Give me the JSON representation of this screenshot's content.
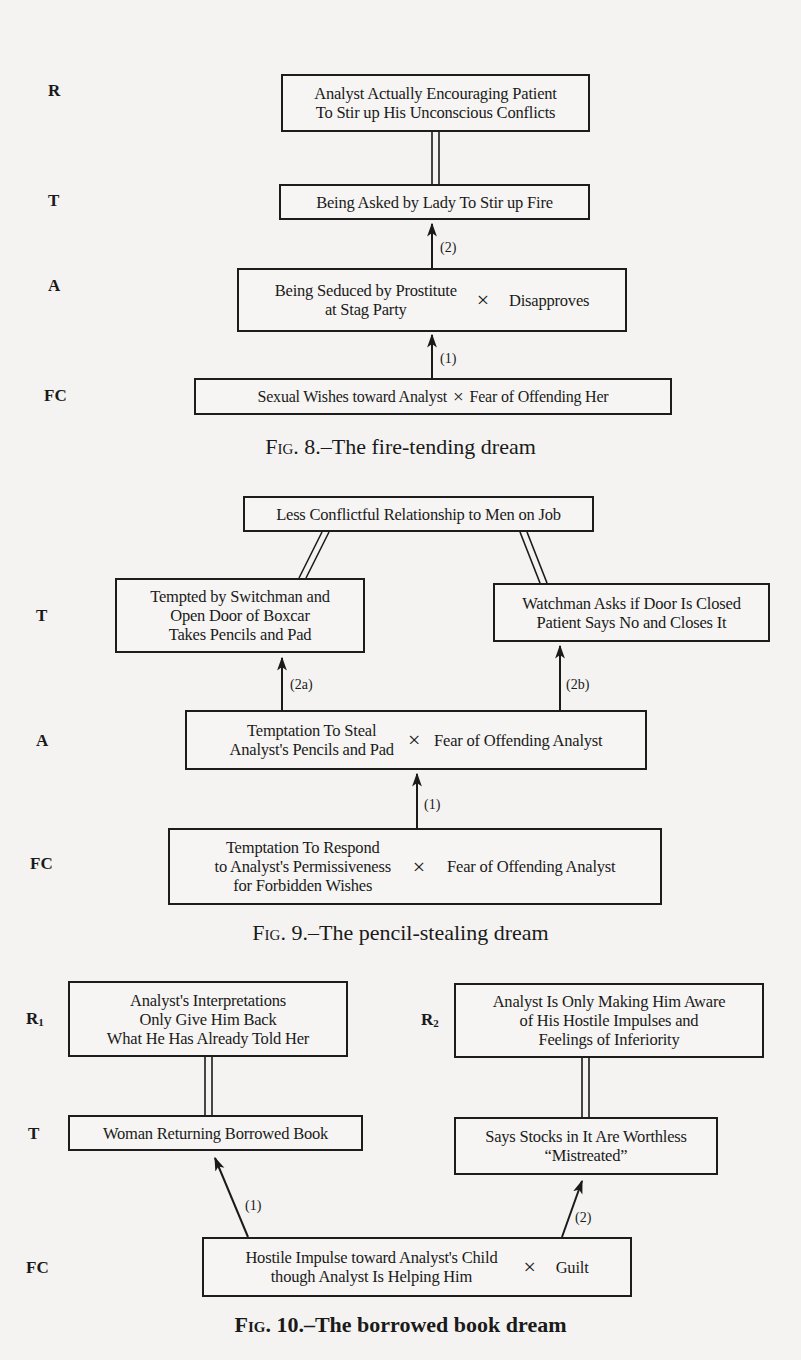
{
  "figures": [
    {
      "id": "fig8",
      "caption_prefix": "Fig. 8.",
      "caption_title": "–The fire-tending dream",
      "levels": {
        "R": "R",
        "T": "T",
        "A": "A",
        "FC": "FC"
      },
      "boxes": {
        "R": [
          "Analyst Actually Encouraging Patient",
          "To Stir up His Unconscious Conflicts"
        ],
        "T": [
          "Being Asked by Lady To Stir up Fire"
        ],
        "A": {
          "left": [
            "Being Seduced by Prostitute",
            "at Stag Party"
          ],
          "op": "×",
          "right": "Disapproves"
        },
        "FC": {
          "left": [
            "Sexual Wishes toward Analyst"
          ],
          "op": "×",
          "right": "Fear of Offending Her"
        }
      },
      "arrows": {
        "a2": "(2)",
        "a1": "(1)"
      }
    },
    {
      "id": "fig9",
      "caption_prefix": "Fig. 9.",
      "caption_title": "–The pencil-stealing dream",
      "levels": {
        "T": "T",
        "A": "A",
        "FC": "FC"
      },
      "boxes": {
        "TOP": [
          "Less Conflictful Relationship to Men on Job"
        ],
        "T_left": [
          "Tempted by Switchman and",
          "Open Door of Boxcar",
          "Takes Pencils and Pad"
        ],
        "T_right": [
          "Watchman Asks if Door Is Closed",
          "Patient Says No and Closes It"
        ],
        "A": {
          "left": [
            "Temptation To Steal",
            "Analyst's Pencils and Pad"
          ],
          "op": "×",
          "right": "Fear of Offending Analyst"
        },
        "FC": {
          "left": [
            "Temptation To Respond",
            "to Analyst's Permissiveness",
            "for Forbidden Wishes"
          ],
          "op": "×",
          "right": "Fear of Offending Analyst"
        }
      },
      "arrows": {
        "a2a": "(2a)",
        "a2b": "(2b)",
        "a1": "(1)"
      }
    },
    {
      "id": "fig10",
      "caption_prefix": "Fig. 10.",
      "caption_title": "–The borrowed book dream",
      "levels": {
        "R1": "R",
        "R1_sub": "1",
        "R2": "R",
        "R2_sub": "2",
        "T": "T",
        "FC": "FC"
      },
      "boxes": {
        "R1": [
          "Analyst's Interpretations",
          "Only Give Him Back",
          "What He Has Already Told Her"
        ],
        "R2": [
          "Analyst Is Only Making Him Aware",
          "of His Hostile Impulses and",
          "Feelings of Inferiority"
        ],
        "T1": [
          "Woman Returning Borrowed Book"
        ],
        "T2": [
          "Says Stocks in It Are Worthless",
          "“Mistreated”"
        ],
        "FC": {
          "left": [
            "Hostile Impulse toward Analyst's Child",
            "though Analyst Is Helping Him"
          ],
          "op": "×",
          "right": "Guilt"
        }
      },
      "arrows": {
        "a1": "(1)",
        "a2": "(2)"
      }
    }
  ]
}
